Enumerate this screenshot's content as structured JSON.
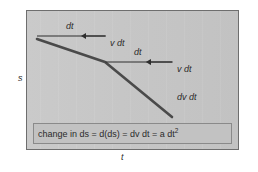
{
  "figure": {
    "kind": "kinematics-displacement-diagram",
    "panel": {
      "fill": "#c7c7c7",
      "border": "#6e6e6e",
      "x": 26,
      "y": 10,
      "width": 213,
      "height": 140
    },
    "axes": {
      "y_label": "s",
      "x_label": "t"
    },
    "curve": {
      "color": "#4a4a4a",
      "description": "downward-curving displacement versus time line",
      "points": [
        {
          "x": 37,
          "y": 39
        },
        {
          "x": 105,
          "y": 62
        },
        {
          "x": 172,
          "y": 117
        }
      ]
    },
    "annotations": [
      {
        "id": "dt-1",
        "label": "dt",
        "type": "horizontal-run",
        "from": {
          "x": 37,
          "y": 36
        },
        "to": {
          "x": 105,
          "y": 36
        }
      },
      {
        "id": "v-dt-1",
        "label": "v dt",
        "type": "vertical-arrow",
        "from": {
          "x": 105,
          "y": 36
        },
        "to": {
          "x": 105,
          "y": 62
        }
      },
      {
        "id": "dt-2",
        "label": "dt",
        "type": "horizontal-run",
        "from": {
          "x": 105,
          "y": 62
        },
        "to": {
          "x": 172,
          "y": 62
        }
      },
      {
        "id": "v-dt-2",
        "label": "v dt",
        "type": "vertical-arrow",
        "from": {
          "x": 172,
          "y": 62
        },
        "to": {
          "x": 172,
          "y": 90
        }
      },
      {
        "id": "dv-dt",
        "label": "dv dt",
        "type": "gap-label",
        "at": {
          "x": 177,
          "y": 93
        }
      }
    ],
    "equation": {
      "box": {
        "x": 33,
        "y": 123,
        "width": 199,
        "height": 21,
        "fill": "#c2c2c2",
        "border": "#8a8a8a"
      },
      "text_parts": {
        "lead": "change in ds = d(ds) = dv dt = a dt",
        "exponent": "2"
      }
    },
    "colors": {
      "panel_fill": "#c7c7c7",
      "panel_border": "#6e6e6e",
      "curve": "#4a4a4a",
      "annotation_line": "#3c3c3c",
      "text": "#2b2b2b",
      "page_background": "#ffffff"
    }
  }
}
